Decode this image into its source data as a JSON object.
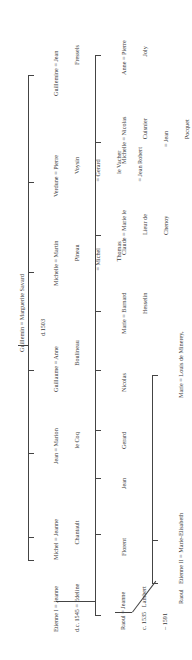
{
  "root": {
    "couple": "Guillemin = Marguerite Savard",
    "note": "d.1503"
  },
  "generation2": [
    {
      "id": "etienne1",
      "lines": [
        "Etienne I = Jeanne",
        "d.c. 1545 = Edeline"
      ]
    },
    {
      "id": "michel",
      "lines": [
        "Michel = Jeanne",
        "          Chantault"
      ]
    },
    {
      "id": "jean",
      "lines": [
        "Jean = Marion",
        "          le Coq"
      ]
    },
    {
      "id": "guillaume",
      "lines": [
        "Guillaume = Anne",
        "                 Boulineau"
      ]
    },
    {
      "id": "michelle",
      "lines": [
        "Michelle = Martin",
        "                Pineau",
        "          = Michel",
        "                Thomas"
      ]
    },
    {
      "id": "verdune",
      "lines": [
        "Verdune = Pierre",
        "               Voysin",
        "          = Gerard",
        "               le Vacher",
        "          = Jean Robert"
      ]
    },
    {
      "id": "guillemine",
      "lines": [
        "Guillemine = Jean",
        "                    Fressels"
      ]
    }
  ],
  "generation3": [
    {
      "id": "raoul",
      "lines": [
        "Raoul = Jeanne",
        "c. 1535   Lambert",
        "– 1591"
      ]
    },
    {
      "id": "florent",
      "lines": [
        "Florent"
      ]
    },
    {
      "id": "jean2",
      "lines": [
        "Jean"
      ]
    },
    {
      "id": "gerard",
      "lines": [
        "Gerard"
      ]
    },
    {
      "id": "nicolas",
      "lines": [
        "Nicolas"
      ]
    },
    {
      "id": "marie",
      "lines": [
        "Marie = Barnard",
        "             Hesselin"
      ]
    },
    {
      "id": "claude",
      "lines": [
        "Claude = Marie le",
        "             Lieur de",
        "             Chenoy"
      ]
    },
    {
      "id": "michelle2",
      "lines": [
        "Michelle = Nicolas",
        "                Cuisnier",
        "           = Jean",
        "                Pocquet"
      ]
    },
    {
      "id": "anne",
      "lines": [
        "Anne = Pierre",
        "            Joly"
      ]
    }
  ],
  "generation4": [
    {
      "id": "raoul2",
      "lines": [
        "Raoul"
      ]
    },
    {
      "id": "etienne2",
      "lines": [
        "Etienne II = Marie-Elisabeth",
        "1560 –          Chapellier",
        "1635"
      ]
    },
    {
      "id": "marie2",
      "lines": [
        "Marie = Louis de Minerey,",
        "             sieur de la Grande Noué"
      ]
    }
  ]
}
